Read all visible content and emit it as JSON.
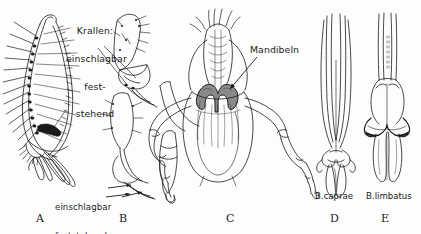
{
  "figure": {
    "background_color": "#fdfdfd",
    "ink_color": "#1a1a1a",
    "mandible_fill": "#8a8a8a",
    "claw_fill": "#1a1a1a",
    "width": 421,
    "height": 234
  },
  "annotations": {
    "krallen": {
      "line1": "Krallen:",
      "line2": "einschlagbar",
      "line3": "fest-",
      "line4": "stehend"
    },
    "lower_left": {
      "line1": "einschlagbar",
      "line2": "feststehend"
    },
    "mandibeln": "Mandibeln"
  },
  "species": {
    "caprae": "B.caprae",
    "limbatus": "B.limbatus"
  },
  "panel_letters": {
    "a": "A",
    "b": "B",
    "c": "C",
    "d": "D",
    "e": "E"
  }
}
